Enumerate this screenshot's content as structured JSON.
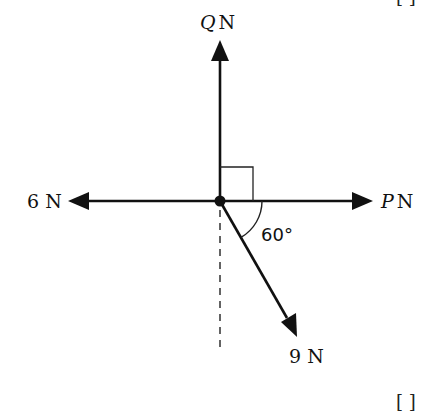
{
  "diagram": {
    "type": "force-diagram",
    "colors": {
      "ink": "#111111",
      "background": "#ffffff"
    },
    "origin": {
      "x": 220,
      "y": 201
    },
    "forces": [
      {
        "id": "Q",
        "symbol": "Q",
        "unit": "N",
        "direction": "up",
        "label_symbol": "Q",
        "label_unit": "N"
      },
      {
        "id": "P",
        "symbol": "P",
        "unit": "N",
        "direction": "right",
        "label_symbol": "P",
        "label_unit": "N"
      },
      {
        "id": "six",
        "label": "6 N",
        "direction": "left"
      },
      {
        "id": "nine",
        "label": "9 N",
        "direction": "60° below horizontal, to the right"
      }
    ],
    "angle_label": "60°",
    "right_angle_marker": true,
    "dashed_reference_line": "vertical below origin",
    "marks": {
      "top": "[ ]",
      "bottom": "[ ]"
    }
  }
}
